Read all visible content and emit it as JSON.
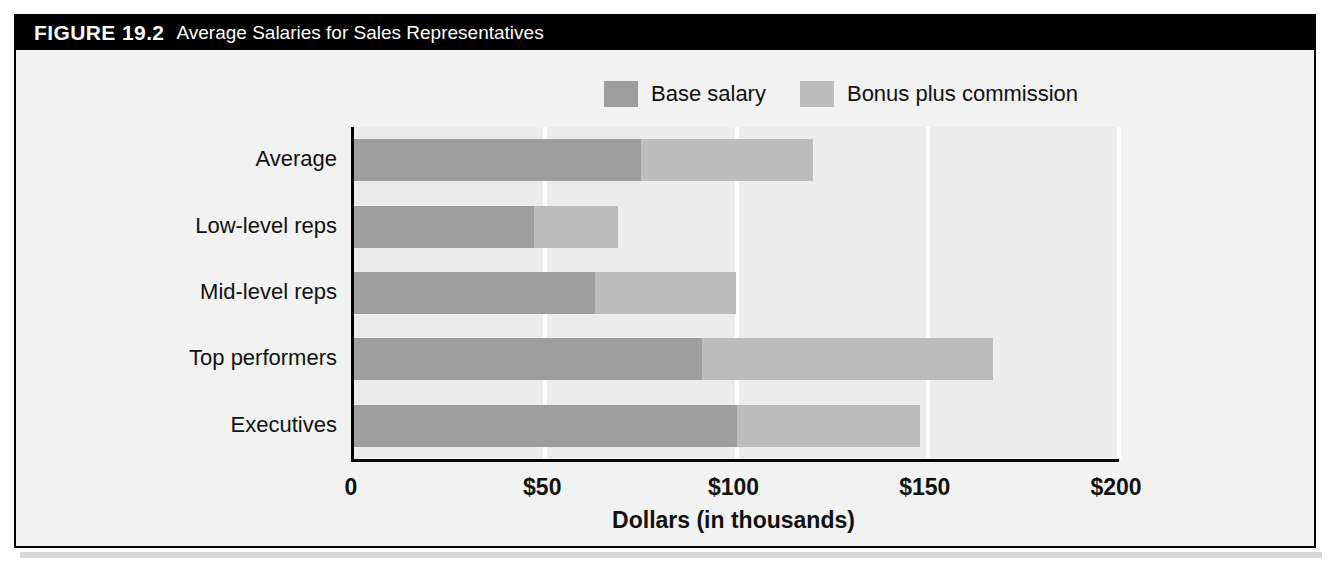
{
  "figure": {
    "label": "FIGURE 19.2",
    "title": "Average Salaries for Sales Representatives"
  },
  "colors": {
    "base": "#9d9d9d",
    "bonus": "#bcbcbc",
    "plot_background": "#ececec",
    "frame_background": "#f2f2f2",
    "titlebar_background": "#000000",
    "titlebar_text": "#ffffff",
    "gridline": "#ffffff",
    "axis": "#000000"
  },
  "legend": {
    "position": "top-right",
    "items": [
      {
        "label": "Base salary",
        "color": "#9d9d9d"
      },
      {
        "label": "Bonus plus commission",
        "color": "#bcbcbc"
      }
    ]
  },
  "chart_data": {
    "type": "bar",
    "orientation": "horizontal",
    "stacked": true,
    "title": "Average Salaries for Sales Representatives",
    "xlabel": "Dollars (in thousands)",
    "ylabel": "",
    "xlim": [
      0,
      200
    ],
    "xticks": [
      0,
      50,
      100,
      150,
      200
    ],
    "xticklabels": [
      "0",
      "$50",
      "$100",
      "$150",
      "$200"
    ],
    "grid": "vertical",
    "categories": [
      "Average",
      "Low-level reps",
      "Mid-level reps",
      "Top performers",
      "Executives"
    ],
    "series": [
      {
        "name": "Base salary",
        "color": "#9d9d9d",
        "values": [
          75,
          47,
          63,
          91,
          100
        ]
      },
      {
        "name": "Bonus plus commission",
        "color": "#bcbcbc",
        "values": [
          45,
          22,
          37,
          76,
          48
        ]
      }
    ],
    "totals": [
      120,
      69,
      100,
      167,
      148
    ]
  }
}
